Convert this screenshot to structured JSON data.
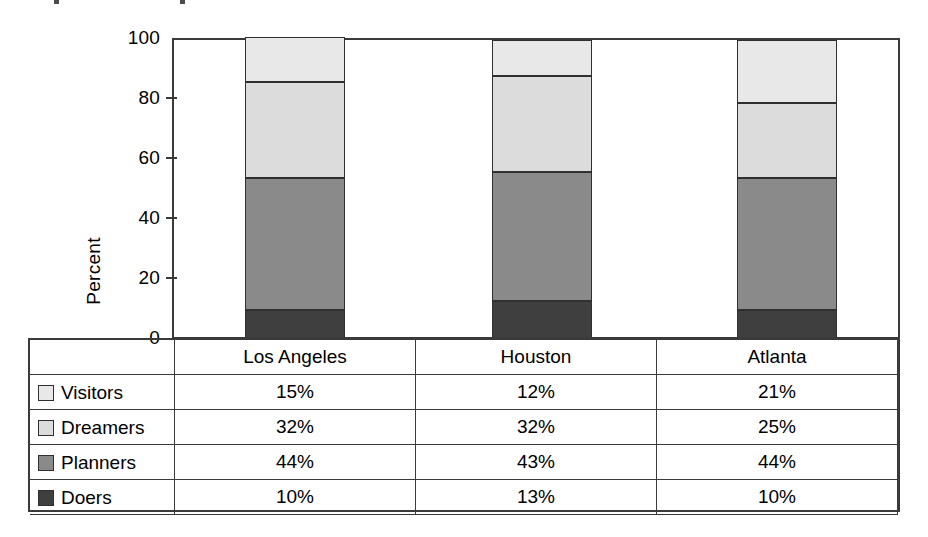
{
  "chart_data": {
    "type": "bar",
    "subtype": "100% stacked column",
    "title": "",
    "xlabel": "",
    "ylabel": "Percent",
    "ylim": [
      0,
      100
    ],
    "yticks": [
      0,
      20,
      40,
      60,
      80,
      100
    ],
    "grid": false,
    "legend_position": "table-below",
    "categories": [
      "Los Angeles",
      "Houston",
      "Atlanta"
    ],
    "stack_order_bottom_to_top": [
      "Doers",
      "Planners",
      "Dreamers",
      "Visitors"
    ],
    "series": [
      {
        "name": "Visitors",
        "values": [
          15,
          12,
          21
        ],
        "labels": [
          "15%",
          "12%",
          "21%"
        ],
        "color": "#e8e8e8"
      },
      {
        "name": "Dreamers",
        "values": [
          32,
          32,
          25
        ],
        "labels": [
          "32%",
          "32%",
          "25%"
        ],
        "color": "#dcdcdc"
      },
      {
        "name": "Planners",
        "values": [
          44,
          43,
          44
        ],
        "labels": [
          "44%",
          "43%",
          "44%"
        ],
        "color": "#8a8a8a"
      },
      {
        "name": "Doers",
        "values": [
          10,
          13,
          10
        ],
        "labels": [
          "10%",
          "13%",
          "10%"
        ],
        "color": "#3f3f3f"
      }
    ]
  },
  "axis": {
    "y_title": "Percent",
    "ticks": [
      "100",
      "80",
      "60",
      "40",
      "20",
      "0"
    ]
  },
  "table": {
    "corner_label": "",
    "column_headers": [
      "Los Angeles",
      "Houston",
      "Atlanta"
    ],
    "rows": [
      {
        "label": "Visitors",
        "swatch": "#e8e8e8",
        "values": [
          "15%",
          "12%",
          "21%"
        ]
      },
      {
        "label": "Dreamers",
        "swatch": "#dcdcdc",
        "values": [
          "32%",
          "32%",
          "25%"
        ]
      },
      {
        "label": "Planners",
        "swatch": "#8a8a8a",
        "values": [
          "44%",
          "43%",
          "44%"
        ]
      },
      {
        "label": "Doers",
        "swatch": "#3f3f3f",
        "values": [
          "10%",
          "13%",
          "10%"
        ]
      }
    ]
  }
}
